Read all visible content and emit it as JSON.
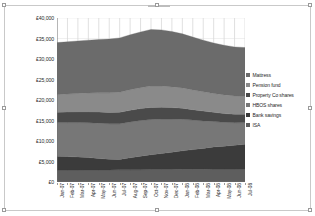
{
  "chart_data": {
    "type": "area",
    "stacked": true,
    "title": "",
    "xlabel": "",
    "ylabel": "",
    "ylim": [
      0,
      40000
    ],
    "ytick_labels": [
      "£40,000",
      "£35,000",
      "£30,000",
      "£25,000",
      "£20,000",
      "£15,000",
      "£10,000",
      "£5,000",
      "£0"
    ],
    "ytick_values": [
      40000,
      35000,
      30000,
      25000,
      20000,
      15000,
      10000,
      5000,
      0
    ],
    "grid": "vertical",
    "legend_position": "right",
    "categories": [
      "Jan-07",
      "Feb-07",
      "Mar-07",
      "Apr-07",
      "May-07",
      "Jun-07",
      "Jul-07",
      "Aug-07",
      "Sep-07",
      "Oct-07",
      "Nov-07",
      "Dec-07",
      "Jan-08",
      "Feb-08",
      "Mar-08",
      "Apr-08",
      "May-08",
      "Jun-08",
      "Jul-08"
    ],
    "series": [
      {
        "name": "ISA",
        "color": "#5e5e5e",
        "values": [
          2900,
          2900,
          2900,
          2950,
          2950,
          2950,
          3000,
          3000,
          3000,
          3050,
          3050,
          3050,
          3100,
          3100,
          3100,
          3150,
          3150,
          3150,
          3200
        ]
      },
      {
        "name": "Bank savings",
        "color": "#3b3b3b",
        "values": [
          3400,
          3300,
          3200,
          3000,
          2800,
          2600,
          2500,
          2900,
          3300,
          3600,
          3900,
          4200,
          4500,
          4800,
          5100,
          5400,
          5600,
          5800,
          6000
        ]
      },
      {
        "name": "HBOS shares",
        "color": "#777777",
        "values": [
          8200,
          8300,
          8400,
          8500,
          8600,
          8650,
          8700,
          8750,
          8700,
          8600,
          8400,
          8100,
          7700,
          7200,
          6700,
          6200,
          5800,
          5500,
          5300
        ]
      },
      {
        "name": "Property Co shares",
        "color": "#4a4a4a",
        "values": [
          2500,
          2550,
          2600,
          2650,
          2700,
          2750,
          2800,
          2850,
          2900,
          2950,
          2900,
          2800,
          2700,
          2550,
          2400,
          2250,
          2150,
          2050,
          2000
        ]
      },
      {
        "name": "Pension fund",
        "color": "#8a8a8a",
        "values": [
          4300,
          4400,
          4500,
          4600,
          4700,
          4800,
          4900,
          5000,
          5100,
          5200,
          5150,
          5050,
          4950,
          4800,
          4700,
          4600,
          4550,
          4500,
          4450
        ]
      },
      {
        "name": "Mattress",
        "color": "#6b6b6b",
        "values": [
          12700,
          12750,
          12800,
          12900,
          13000,
          13100,
          13250,
          13400,
          13600,
          13800,
          13700,
          13500,
          13200,
          12900,
          12600,
          12300,
          12100,
          11950,
          11850
        ]
      }
    ],
    "totals": [
      34000,
      34200,
      34400,
      34600,
      34750,
      34850,
      35150,
      35900,
      36600,
      37200,
      37100,
      36700,
      36150,
      35350,
      34600,
      33900,
      33350,
      32950,
      32800
    ]
  },
  "legend": {
    "items": [
      {
        "label": "Mattress",
        "color": "#6b6b6b"
      },
      {
        "label": "Pension fund",
        "color": "#8a8a8a"
      },
      {
        "label": "Property Co shares",
        "color": "#4a4a4a"
      },
      {
        "label": "HBOS shares",
        "color": "#777777"
      },
      {
        "label": "Bank savings",
        "color": "#3b3b3b"
      },
      {
        "label": "ISA",
        "color": "#5e5e5e"
      }
    ]
  }
}
